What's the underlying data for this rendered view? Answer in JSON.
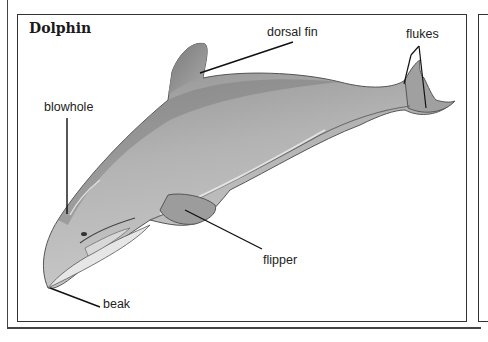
{
  "figure": {
    "title": "Dolphin",
    "labels": {
      "dorsal_fin": "dorsal fin",
      "flukes": "flukes",
      "blowhole": "blowhole",
      "flipper": "flipper",
      "beak": "beak"
    }
  }
}
